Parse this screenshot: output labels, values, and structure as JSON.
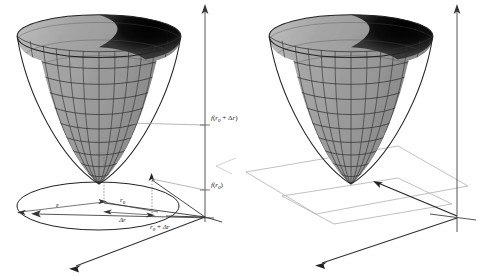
{
  "figure": {
    "title": "",
    "type": "3d-surface-diagram",
    "panel_count": 2,
    "background_color": "#ffffff",
    "surface_color": "#a8a8a8",
    "mesh_line_color": "#2b2b2b",
    "interior_shadow_color": "#000000",
    "axis_color": "#4a4a4a",
    "plane_color": "#b9b9b9",
    "label_color": "#1a1a1a"
  },
  "left_panel": {
    "name": "paraboloid-with-radius-annotations",
    "labels": {
      "f_r0_plus_dr": {
        "full": "f(r0 + Δr)",
        "func": "f",
        "open": "(",
        "var": "r",
        "sub": "0",
        "plus": " + ",
        "delta": "Δ",
        "var2": "r",
        "close": ")"
      },
      "f_r0": {
        "full": "f(r0)",
        "func": "f",
        "open": "(",
        "var": "r",
        "sub": "0",
        "close": ")"
      },
      "epsilon": "ε",
      "r0": {
        "var": "r",
        "sub": "0"
      },
      "delta_r": "Δr",
      "r0_plus_dr": {
        "var": "r",
        "sub": "0",
        "plus": " + ",
        "delta_r": "Δr"
      }
    },
    "features": [
      "vertical-axis-arrow-up",
      "horizontal-axis-arrow-left",
      "depth-axis-arrow-down-left",
      "ground-ellipse",
      "epsilon-radius-segment",
      "r0-radius-segment",
      "delta-r-segment",
      "dotted-projection-line-r0",
      "dotted-projection-line-r0-plus-dr",
      "level-line-to-f-r0",
      "level-line-to-f-r0-plus-dr"
    ]
  },
  "right_panel": {
    "name": "paraboloid-with-tangent-plane",
    "labels": {},
    "features": [
      "vertical-axis-arrow-up",
      "horizontal-axis-arrow-left",
      "depth-axis-arrow-down-left",
      "base-plane-parallelogram",
      "secondary-plane-parallelogram",
      "vertex-pointer-arrow"
    ]
  }
}
